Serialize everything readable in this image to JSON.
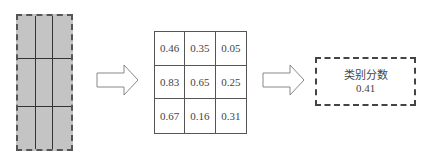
{
  "feature_map": {
    "rows": 3,
    "cols": 3,
    "fill": "#c4c4c4"
  },
  "score_grid": {
    "cells": [
      "0.46",
      "0.35",
      "0.05",
      "0.83",
      "0.65",
      "0.25",
      "0.67",
      "0.16",
      "0.31"
    ]
  },
  "result": {
    "label": "类别分数",
    "value": "0.41"
  },
  "arrows": [
    "right-arrow",
    "right-arrow"
  ]
}
